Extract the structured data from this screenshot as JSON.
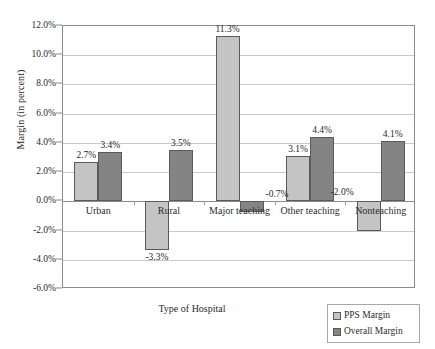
{
  "chart_data": {
    "type": "bar",
    "title": "",
    "xlabel": "Type of Hospital",
    "ylabel": "Margin (in percent)",
    "categories": [
      "Urban",
      "Rural",
      "Major teaching",
      "Other teaching",
      "Nonteaching"
    ],
    "series": [
      {
        "name": "PPS Margin",
        "color": "#c4c4c4",
        "values": [
          2.7,
          -3.3,
          11.3,
          3.1,
          -2.0
        ],
        "labels": [
          "2.7%",
          "-3.3%",
          "11.3%",
          "3.1%",
          "-2.0%"
        ]
      },
      {
        "name": "Overall Margin",
        "color": "#848484",
        "values": [
          3.4,
          3.5,
          -0.7,
          4.4,
          4.1
        ],
        "labels": [
          "3.4%",
          "3.5%",
          "-0.7%",
          "4.4%",
          "4.1%"
        ]
      }
    ],
    "ylim": [
      -6.0,
      12.0
    ],
    "yticks": [
      12.0,
      10.0,
      8.0,
      6.0,
      4.0,
      2.0,
      0.0,
      -2.0,
      -4.0,
      -6.0
    ],
    "ytick_labels": [
      "12.0%",
      "10.0%",
      "8.0%",
      "6.0%",
      "4.0%",
      "2.0%",
      "0.0%",
      "-2.0%",
      "-4.0%",
      "-6.0%"
    ],
    "grid": true,
    "legend_position": "bottom-right"
  },
  "legend": {
    "entries": [
      {
        "label": "PPS Margin",
        "swatch": "pps"
      },
      {
        "label": "Overall Margin",
        "swatch": "overall"
      }
    ]
  }
}
